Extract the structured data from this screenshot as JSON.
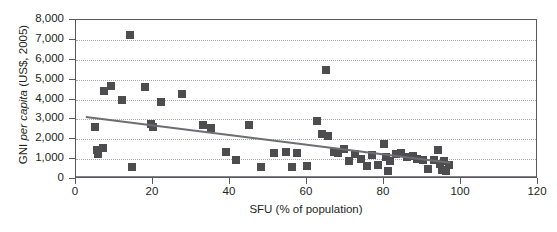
{
  "chart_data": {
    "type": "scatter",
    "title": "",
    "xlabel": "SFU (% of population)",
    "ylabel": "GNI per capita (US$, 2005)",
    "ylabel_parts": [
      "GNI ",
      "per capita",
      " (US$, 2005)"
    ],
    "xlim": [
      0,
      120
    ],
    "ylim": [
      0,
      8000
    ],
    "xticks": [
      0,
      20,
      40,
      60,
      80,
      100,
      120
    ],
    "xtick_labels": [
      "0",
      "20",
      "40",
      "60",
      "80",
      "100",
      "120"
    ],
    "yticks": [
      0,
      1000,
      2000,
      3000,
      4000,
      5000,
      6000,
      7000,
      8000
    ],
    "ytick_labels": [
      "0",
      "1,000",
      "2,000",
      "3,000",
      "4,000",
      "5,000",
      "6,000",
      "7,000",
      "8,000"
    ],
    "grid": "horizontal-dotted",
    "legend": "none",
    "marker": "filled-square",
    "marker_color": "#4d4d4f",
    "trendline_color": "#6d6e71",
    "frame_color": "#58595b",
    "gridline_color": "#a7a9ac",
    "trendline": {
      "x0": 2.5,
      "y0": 3180,
      "x1": 97,
      "y1": 880
    },
    "points": [
      {
        "x": 5.0,
        "y": 2600
      },
      {
        "x": 5.5,
        "y": 1450
      },
      {
        "x": 5.8,
        "y": 1250
      },
      {
        "x": 7.0,
        "y": 1550
      },
      {
        "x": 7.2,
        "y": 4450
      },
      {
        "x": 9.0,
        "y": 4700
      },
      {
        "x": 12.0,
        "y": 3950
      },
      {
        "x": 14.0,
        "y": 7250
      },
      {
        "x": 14.5,
        "y": 600
      },
      {
        "x": 18.0,
        "y": 4650
      },
      {
        "x": 19.5,
        "y": 2750
      },
      {
        "x": 20.0,
        "y": 2600
      },
      {
        "x": 22.0,
        "y": 3850
      },
      {
        "x": 27.5,
        "y": 4300
      },
      {
        "x": 33.0,
        "y": 2700
      },
      {
        "x": 35.0,
        "y": 2550
      },
      {
        "x": 39.0,
        "y": 1350
      },
      {
        "x": 41.5,
        "y": 950
      },
      {
        "x": 45.0,
        "y": 2700
      },
      {
        "x": 48.0,
        "y": 600
      },
      {
        "x": 51.5,
        "y": 1300
      },
      {
        "x": 54.5,
        "y": 1350
      },
      {
        "x": 56.0,
        "y": 600
      },
      {
        "x": 57.5,
        "y": 1300
      },
      {
        "x": 60.0,
        "y": 650
      },
      {
        "x": 62.5,
        "y": 2900
      },
      {
        "x": 64.0,
        "y": 2250
      },
      {
        "x": 65.0,
        "y": 5500
      },
      {
        "x": 65.5,
        "y": 2150
      },
      {
        "x": 67.0,
        "y": 1350
      },
      {
        "x": 68.0,
        "y": 1300
      },
      {
        "x": 69.5,
        "y": 1500
      },
      {
        "x": 71.0,
        "y": 900
      },
      {
        "x": 72.5,
        "y": 1250
      },
      {
        "x": 74.0,
        "y": 1000
      },
      {
        "x": 75.5,
        "y": 650
      },
      {
        "x": 77.0,
        "y": 1200
      },
      {
        "x": 78.5,
        "y": 700
      },
      {
        "x": 80.0,
        "y": 1750
      },
      {
        "x": 80.5,
        "y": 1100
      },
      {
        "x": 81.0,
        "y": 400
      },
      {
        "x": 81.5,
        "y": 900
      },
      {
        "x": 83.0,
        "y": 1250
      },
      {
        "x": 84.5,
        "y": 1300
      },
      {
        "x": 86.0,
        "y": 1100
      },
      {
        "x": 87.5,
        "y": 1150
      },
      {
        "x": 88.5,
        "y": 1000
      },
      {
        "x": 90.0,
        "y": 950
      },
      {
        "x": 91.5,
        "y": 500
      },
      {
        "x": 93.0,
        "y": 950
      },
      {
        "x": 94.0,
        "y": 1450
      },
      {
        "x": 94.5,
        "y": 750
      },
      {
        "x": 95.0,
        "y": 450
      },
      {
        "x": 95.5,
        "y": 900
      },
      {
        "x": 96.0,
        "y": 400
      },
      {
        "x": 97.0,
        "y": 700
      }
    ]
  }
}
